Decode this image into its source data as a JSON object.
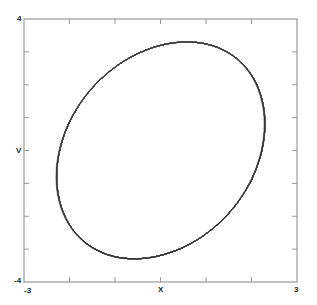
{
  "chart_data": {
    "type": "line",
    "title": "",
    "xlabel": "X",
    "ylabel": "V",
    "xlim": [
      -3,
      3
    ],
    "ylim": [
      -4,
      4
    ],
    "x_tick_labels_shown": [
      "-3",
      "3"
    ],
    "y_tick_labels_shown": [
      "-4",
      "4"
    ],
    "x_ticks": [
      -3,
      -2,
      -1,
      0,
      1,
      2,
      3
    ],
    "y_ticks": [
      -4,
      -3,
      -2,
      -1,
      0,
      1,
      2,
      3,
      4
    ],
    "grid": false,
    "legend": null,
    "series": [
      {
        "name": "phase trajectory (chaotic attractor)",
        "description": "Dense grayscale phase-space trajectory of a forced nonlinear oscillator; loops span X≈-2.3..2.3, V≈-3.2..3.2 with small spirals near (X≈-0.8,V≈0) and (X≈-0.2,V≈0)",
        "approx_extent": {
          "x_min": -2.3,
          "x_max": 2.3,
          "v_min": -3.2,
          "v_max": 3.2
        },
        "key_points": [
          {
            "x": -2.3,
            "v": 0.2,
            "note": "left corner"
          },
          {
            "x": 0.95,
            "v": 3.2,
            "note": "top peak"
          },
          {
            "x": 2.3,
            "v": 0.0,
            "note": "right edge"
          },
          {
            "x": -0.8,
            "v": -3.2,
            "note": "bottom"
          },
          {
            "x": -0.8,
            "v": 0.0,
            "note": "inner spiral"
          }
        ]
      }
    ]
  },
  "labels": {
    "y_top": "4",
    "y_bottom": "-4",
    "x_left": "-3",
    "x_right": "3",
    "x_axis": "X",
    "y_axis": "V"
  },
  "style": {
    "line_color": "#3a3a3a",
    "frame_color": "#9a9a9a"
  }
}
